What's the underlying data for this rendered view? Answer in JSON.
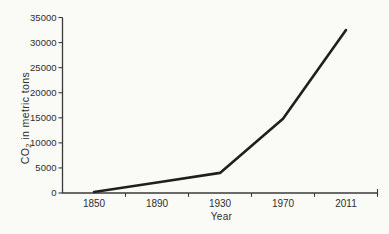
{
  "page": {
    "background": "#fafaf7"
  },
  "chart_data": {
    "type": "line",
    "title": "",
    "xlabel": "Year",
    "ylabel": "CO2 in metric tons",
    "ylabel_parts": {
      "base": "CO",
      "subscript": "2",
      "rest": " in metric tons"
    },
    "categories": [
      "1850",
      "1890",
      "1930",
      "1970",
      "2011"
    ],
    "series": [
      {
        "name": "CO2 in metric tons",
        "values": [
          200,
          2100,
          4000,
          14800,
          32500
        ]
      }
    ],
    "ylim": [
      0,
      35000
    ],
    "ytick_step": 5000,
    "yticks": [
      0,
      5000,
      10000,
      15000,
      20000,
      25000,
      30000,
      35000
    ],
    "grid": false,
    "legend_position": "none",
    "tick_style": "outside, ticks between categories on x-axis",
    "colors": {
      "line": "#1f1f1f",
      "axis": "#3a3a3a",
      "text": "#2e2e2e"
    }
  }
}
